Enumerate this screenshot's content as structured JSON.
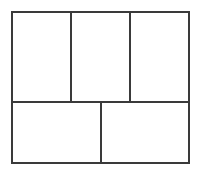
{
  "diagram": {
    "type": "grid-layout",
    "line_color": "#3a3a3a",
    "background_color": "#ffffff",
    "line_width": 2,
    "outer_frame": {
      "x": 12,
      "y": 12,
      "width": 177,
      "height": 151
    },
    "rows": [
      {
        "name": "top-row",
        "y_start": 12,
        "y_end": 102,
        "cells": [
          {
            "name": "top-left",
            "x_start": 12,
            "x_end": 71,
            "label": ""
          },
          {
            "name": "top-center",
            "x_start": 71,
            "x_end": 130,
            "label": ""
          },
          {
            "name": "top-right",
            "x_start": 130,
            "x_end": 189,
            "label": ""
          }
        ]
      },
      {
        "name": "bottom-row",
        "y_start": 102,
        "y_end": 163,
        "cells": [
          {
            "name": "bottom-left",
            "x_start": 12,
            "x_end": 101,
            "label": ""
          },
          {
            "name": "bottom-right",
            "x_start": 101,
            "x_end": 189,
            "label": ""
          }
        ]
      }
    ]
  }
}
